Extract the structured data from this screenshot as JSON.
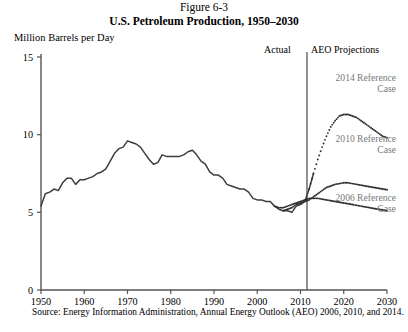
{
  "figure": {
    "number": "Figure 6-3",
    "title": "U.S. Petroleum Production, 1950–2030",
    "source": "Source: Energy Information Administration, Annual Energy Outlook (AEO) 2006, 2010, and 2014."
  },
  "labels": {
    "yaxis_title": "Million Barrels per Day",
    "actual": "Actual",
    "projections": "AEO Projections",
    "ann_2014": "2014 Reference\nCase",
    "ann_2010": "2010 Reference\nCase",
    "ann_2006": "2006 Reference\nCase"
  },
  "colors": {
    "line": "#3d3d3d",
    "axis": "#555555",
    "annotation": "#7a7a7a",
    "dot": "#2b2b2b"
  },
  "chart_data": {
    "type": "line",
    "title": "U.S. Petroleum Production, 1950–2030",
    "subtitle": "Figure 6-3",
    "xlabel": "",
    "ylabel": "Million Barrels per Day",
    "xlim": [
      1950,
      2030
    ],
    "ylim": [
      0,
      15
    ],
    "yticks": [
      0,
      5,
      10,
      15
    ],
    "xticks": [
      1950,
      1960,
      1970,
      1980,
      1990,
      2000,
      2010,
      2020,
      2030
    ],
    "grid": false,
    "legend": "annotations-inline",
    "divider_year": 2011.5,
    "divider_label_left": "Actual",
    "divider_label_right": "AEO Projections",
    "series": [
      {
        "name": "Actual",
        "style": "solid",
        "x": [
          1950,
          1951,
          1952,
          1953,
          1954,
          1955,
          1956,
          1957,
          1958,
          1959,
          1960,
          1961,
          1962,
          1963,
          1964,
          1965,
          1966,
          1967,
          1968,
          1969,
          1970,
          1971,
          1972,
          1973,
          1974,
          1975,
          1976,
          1977,
          1978,
          1979,
          1980,
          1981,
          1982,
          1983,
          1984,
          1985,
          1986,
          1987,
          1988,
          1989,
          1990,
          1991,
          1992,
          1993,
          1994,
          1995,
          1996,
          1997,
          1998,
          1999,
          2000,
          2001,
          2002,
          2003,
          2004,
          2005,
          2006,
          2007,
          2008,
          2009,
          2010,
          2011,
          2012,
          2013
        ],
        "values": [
          5.4,
          6.2,
          6.3,
          6.5,
          6.4,
          6.9,
          7.2,
          7.2,
          6.8,
          7.1,
          7.1,
          7.2,
          7.3,
          7.5,
          7.6,
          7.8,
          8.3,
          8.8,
          9.1,
          9.2,
          9.6,
          9.5,
          9.4,
          9.2,
          8.8,
          8.4,
          8.1,
          8.2,
          8.7,
          8.6,
          8.6,
          8.6,
          8.6,
          8.7,
          8.9,
          9.0,
          8.7,
          8.3,
          8.1,
          7.6,
          7.4,
          7.4,
          7.2,
          6.8,
          6.7,
          6.6,
          6.5,
          6.5,
          6.3,
          5.9,
          5.8,
          5.8,
          5.7,
          5.7,
          5.4,
          5.2,
          5.1,
          5.1,
          5.0,
          5.4,
          5.5,
          5.7,
          6.5,
          7.5
        ]
      },
      {
        "name": "2014 Reference Case",
        "style": "dotted",
        "x": [
          2012,
          2013,
          2014,
          2015,
          2016,
          2017,
          2018,
          2019,
          2020,
          2021,
          2022,
          2023,
          2024,
          2025,
          2026,
          2027,
          2028,
          2029,
          2030
        ],
        "values": [
          6.5,
          7.5,
          8.4,
          9.2,
          9.9,
          10.5,
          10.9,
          11.2,
          11.3,
          11.3,
          11.2,
          11.1,
          10.9,
          10.7,
          10.5,
          10.3,
          10.1,
          9.9,
          9.8
        ]
      },
      {
        "name": "2010 Reference Case",
        "style": "dotted",
        "x": [
          2006,
          2007,
          2008,
          2009,
          2010,
          2011,
          2012,
          2013,
          2014,
          2015,
          2016,
          2017,
          2018,
          2019,
          2020,
          2021,
          2022,
          2023,
          2024,
          2025,
          2026,
          2027,
          2028,
          2029,
          2030
        ],
        "values": [
          5.1,
          5.2,
          5.3,
          5.5,
          5.6,
          5.7,
          5.8,
          6.0,
          6.2,
          6.4,
          6.6,
          6.7,
          6.8,
          6.85,
          6.9,
          6.9,
          6.85,
          6.8,
          6.75,
          6.7,
          6.65,
          6.6,
          6.55,
          6.5,
          6.45
        ]
      },
      {
        "name": "2006 Reference Case",
        "style": "dotted",
        "x": [
          2004,
          2005,
          2006,
          2007,
          2008,
          2009,
          2010,
          2011,
          2012,
          2013,
          2014,
          2015,
          2016,
          2017,
          2018,
          2019,
          2020,
          2021,
          2022,
          2023,
          2024,
          2025,
          2026,
          2027,
          2028,
          2029,
          2030
        ],
        "values": [
          5.4,
          5.3,
          5.3,
          5.4,
          5.5,
          5.6,
          5.7,
          5.8,
          5.9,
          5.9,
          5.9,
          5.85,
          5.8,
          5.75,
          5.7,
          5.65,
          5.6,
          5.55,
          5.5,
          5.45,
          5.4,
          5.35,
          5.3,
          5.25,
          5.2,
          5.15,
          5.1
        ]
      }
    ]
  }
}
